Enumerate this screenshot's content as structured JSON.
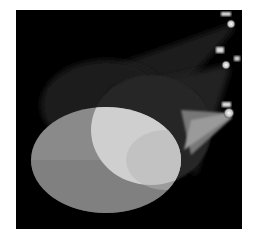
{
  "image": {
    "subject": "Three stage spotlights projecting overlapping elliptical beams onto a dark background",
    "background_color": "#000000",
    "page_color": "#ffffff",
    "spotlights": [
      {
        "name": "top-spotlight",
        "source": [
          215,
          14
        ],
        "beam_color": "#2a2a2a"
      },
      {
        "name": "middle-spotlight",
        "source": [
          210,
          55
        ],
        "beam_color": "#3a3a3a"
      },
      {
        "name": "bottom-spotlight",
        "source": [
          213,
          103
        ],
        "beam_color": "#8a8a8a"
      }
    ],
    "pools": [
      {
        "name": "back-pool",
        "cx": 90,
        "cy": 95,
        "rx": 65,
        "ry": 45,
        "color": "#1e1e1e"
      },
      {
        "name": "middle-pool",
        "cx": 135,
        "cy": 120,
        "rx": 60,
        "ry": 55,
        "color": "#262626"
      },
      {
        "name": "front-pool",
        "cx": 90,
        "cy": 150,
        "rx": 75,
        "ry": 53,
        "color": "#8c8c8c"
      },
      {
        "name": "overlap-highlight",
        "color": "#d6d6d6"
      }
    ]
  }
}
